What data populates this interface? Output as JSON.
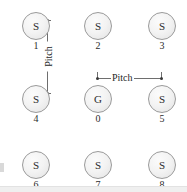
{
  "figure": {
    "kind": "sensor-array-layout-diagram",
    "background_color": "#ffffff",
    "node_outline_color": "#9a9a9a",
    "node_fill_color": "#f2f2f2",
    "annotation_color": "#6e6e6e",
    "text_color": "#2b2b2b"
  },
  "nodes": [
    {
      "glyph": "S",
      "caption": "1",
      "x": 22,
      "y": 12
    },
    {
      "glyph": "S",
      "caption": "2",
      "x": 84,
      "y": 12
    },
    {
      "glyph": "S",
      "caption": "3",
      "x": 148,
      "y": 12
    },
    {
      "glyph": "S",
      "caption": "4",
      "x": 22,
      "y": 85
    },
    {
      "glyph": "G",
      "caption": "0",
      "x": 84,
      "y": 85
    },
    {
      "glyph": "S",
      "caption": "5",
      "x": 148,
      "y": 85
    },
    {
      "glyph": "S",
      "caption": "6",
      "x": 22,
      "y": 151
    },
    {
      "glyph": "S",
      "caption": "7",
      "x": 84,
      "y": 151
    },
    {
      "glyph": "S",
      "caption": "8",
      "x": 148,
      "y": 151
    }
  ],
  "annotations": {
    "vertical_pitch": {
      "label": "Pitch",
      "orientation": "vertical",
      "between": [
        "1",
        "4"
      ]
    },
    "horizontal_pitch": {
      "label": "Pitch",
      "orientation": "horizontal",
      "between": [
        "0",
        "5"
      ]
    }
  }
}
